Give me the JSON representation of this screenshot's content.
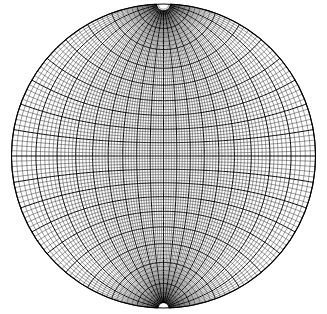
{
  "figure": {
    "background_color": "#ffffff",
    "line_color": "#000000",
    "minor_line_color": "#1a1a1a",
    "width_px": 327,
    "height_px": 314
  },
  "chart_data": {
    "type": "scatter",
    "subtitle": "",
    "projection": "stereographic-equal-angle",
    "orientation": "meridional (poles at top and bottom)",
    "xlabel": "",
    "ylabel": "",
    "grid": "on",
    "legend_position": "none",
    "annotations": [],
    "tick_labels": [],
    "circle": {
      "center_x_px": 163.5,
      "center_y_px": 156.0,
      "radius_px": 152.0,
      "label": "primitive circle (horizon, 90 degrees)"
    },
    "grid_spec": {
      "minor_interval_deg": 2,
      "major_interval_deg": 10,
      "longitude_range_deg": [
        -90,
        90
      ],
      "latitude_range_deg": [
        -90,
        90
      ],
      "minor_linewidth_px": 0.45,
      "major_linewidth_px": 1.0,
      "pole_gap_deg": 2
    },
    "meridians_major_deg": [
      -90,
      -80,
      -70,
      -60,
      -50,
      -40,
      -30,
      -20,
      -10,
      0,
      10,
      20,
      30,
      40,
      50,
      60,
      70,
      80,
      90
    ],
    "parallels_major_deg": [
      -80,
      -70,
      -60,
      -50,
      -40,
      -30,
      -20,
      -10,
      0,
      10,
      20,
      30,
      40,
      50,
      60,
      70,
      80
    ],
    "meridians_minor_deg": [
      -88,
      -86,
      -84,
      -82,
      -78,
      -76,
      -74,
      -72,
      -68,
      -66,
      -64,
      -62,
      -58,
      -56,
      -54,
      -52,
      -48,
      -46,
      -44,
      -42,
      -38,
      -36,
      -34,
      -32,
      -28,
      -26,
      -24,
      -22,
      -18,
      -16,
      -14,
      -12,
      -8,
      -6,
      -4,
      -2,
      2,
      4,
      6,
      8,
      12,
      14,
      16,
      18,
      22,
      24,
      26,
      28,
      32,
      34,
      36,
      38,
      42,
      44,
      46,
      48,
      52,
      54,
      56,
      58,
      62,
      64,
      66,
      68,
      72,
      74,
      76,
      78,
      82,
      84,
      86,
      88
    ],
    "parallels_minor_deg": [
      -88,
      -86,
      -84,
      -82,
      -78,
      -76,
      -74,
      -72,
      -68,
      -66,
      -64,
      -62,
      -58,
      -56,
      -54,
      -52,
      -48,
      -46,
      -44,
      -42,
      -38,
      -36,
      -34,
      -32,
      -28,
      -26,
      -24,
      -22,
      -18,
      -16,
      -14,
      -12,
      -8,
      -6,
      -4,
      -2,
      2,
      4,
      6,
      8,
      12,
      14,
      16,
      18,
      22,
      24,
      26,
      28,
      32,
      34,
      36,
      38,
      42,
      44,
      46,
      48,
      52,
      54,
      56,
      58,
      62,
      64,
      66,
      68,
      72,
      74,
      76,
      78,
      82,
      84,
      86,
      88
    ]
  }
}
